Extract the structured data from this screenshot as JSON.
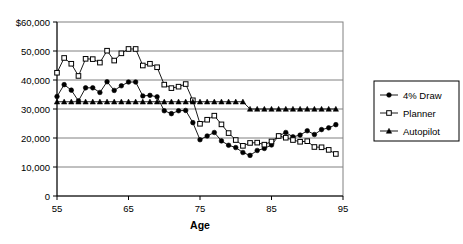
{
  "chart_data": {
    "type": "line",
    "title": "",
    "xlabel": "Age",
    "ylabel": "",
    "xlim": [
      55,
      95
    ],
    "ylim": [
      0,
      60000
    ],
    "grid": true,
    "legend_position": "right",
    "x": [
      55,
      56,
      57,
      58,
      59,
      60,
      61,
      62,
      63,
      64,
      65,
      66,
      67,
      68,
      69,
      70,
      71,
      72,
      73,
      74,
      75,
      76,
      77,
      78,
      79,
      80,
      81,
      82,
      83,
      84,
      85,
      86,
      87,
      88,
      89,
      90,
      91,
      92,
      93,
      94
    ],
    "y_ticks": [
      0,
      10000,
      20000,
      30000,
      40000,
      50000,
      60000
    ],
    "y_tick_labels": [
      "0",
      "10,000",
      "20,000",
      "30,000",
      "40,000",
      "50,000",
      "$60,000"
    ],
    "x_ticks": [
      55,
      65,
      75,
      85,
      95
    ],
    "x_tick_labels": [
      "55",
      "65",
      "75",
      "85",
      "95"
    ],
    "series": [
      {
        "name": "4% Draw",
        "marker": "filled-circle",
        "color": "#000000",
        "values": [
          34300,
          38400,
          36500,
          32800,
          37300,
          37300,
          35700,
          39400,
          36400,
          38000,
          39300,
          39300,
          34500,
          34700,
          34200,
          29400,
          28400,
          29400,
          29500,
          25300,
          19400,
          20700,
          21900,
          19000,
          17500,
          16700,
          15000,
          14000,
          15700,
          16400,
          17600,
          20700,
          21900,
          20400,
          21000,
          22500,
          21200,
          22900,
          23500,
          24600
        ]
      },
      {
        "name": "Planner",
        "marker": "open-square",
        "color": "#000000",
        "values": [
          42500,
          47600,
          45600,
          41400,
          47300,
          47200,
          46000,
          50100,
          46700,
          49200,
          50700,
          50700,
          45000,
          45600,
          44400,
          38400,
          37200,
          37700,
          38600,
          33000,
          24900,
          26300,
          27700,
          24700,
          21700,
          19300,
          17300,
          18300,
          18400,
          17700,
          18800,
          20700,
          20100,
          19300,
          18700,
          18900,
          16900,
          16800,
          15900,
          14500
        ]
      },
      {
        "name": "Autopilot",
        "marker": "filled-triangle",
        "color": "#000000",
        "values": [
          32500,
          32500,
          32500,
          32500,
          32500,
          32500,
          32500,
          32500,
          32500,
          32500,
          32500,
          32500,
          32500,
          32500,
          32500,
          32500,
          32500,
          32500,
          32500,
          32500,
          32500,
          32500,
          32500,
          32500,
          32500,
          32500,
          32500,
          30000,
          30000,
          30000,
          30000,
          30000,
          30000,
          30000,
          30000,
          30000,
          30000,
          30000,
          30000,
          30000
        ]
      }
    ]
  },
  "legend": {
    "items": [
      {
        "label": "4% Draw",
        "marker": "filled-circle"
      },
      {
        "label": "Planner",
        "marker": "open-square"
      },
      {
        "label": "Autopilot",
        "marker": "filled-triangle"
      }
    ]
  },
  "axes": {
    "x_title": "Age"
  }
}
